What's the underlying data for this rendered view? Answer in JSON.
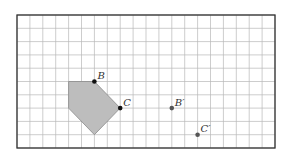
{
  "figure": {
    "grid": {
      "cols": 20,
      "rows": 10,
      "origin_px": [
        17,
        15
      ],
      "cell_w": 12.9,
      "cell_h": 13.3,
      "line_color": "#b8b8b8",
      "border_color": "#333333"
    },
    "shape": {
      "fill": "#bdbdbd",
      "stroke": "#8a8a8a",
      "vertices": [
        [
          4,
          5
        ],
        [
          6,
          5
        ],
        [
          8,
          7
        ],
        [
          6,
          9
        ],
        [
          4,
          7
        ]
      ]
    },
    "points": [
      {
        "name": "B",
        "label": "B",
        "at": [
          6,
          5
        ],
        "color": "#111111"
      },
      {
        "name": "C",
        "label": "C",
        "at": [
          8,
          7
        ],
        "color": "#111111"
      },
      {
        "name": "B-prime",
        "label": "B′",
        "at": [
          12,
          7
        ],
        "color": "#555555"
      },
      {
        "name": "C-prime",
        "label": "C′",
        "at": [
          14,
          9
        ],
        "color": "#555555"
      }
    ]
  }
}
